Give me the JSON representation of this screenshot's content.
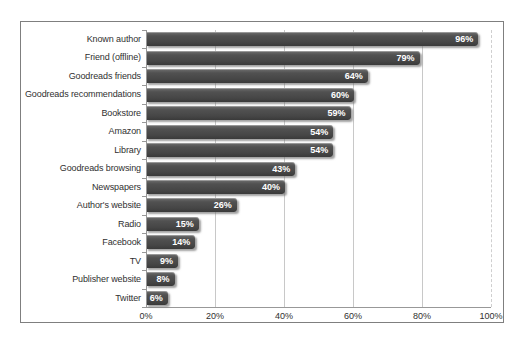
{
  "chart_data": {
    "type": "bar",
    "orientation": "horizontal",
    "title": "",
    "xlabel": "",
    "ylabel": "",
    "categories": [
      "Known author",
      "Friend (offline)",
      "Goodreads friends",
      "Goodreads recommendations",
      "Bookstore",
      "Amazon",
      "Library",
      "Goodreads browsing",
      "Newspapers",
      "Author's website",
      "Radio",
      "Facebook",
      "TV",
      "Publisher website",
      "Twitter"
    ],
    "values": [
      96,
      79,
      64,
      60,
      59,
      54,
      54,
      43,
      40,
      26,
      15,
      14,
      9,
      8,
      6
    ],
    "data_labels": [
      "96%",
      "79%",
      "64%",
      "60%",
      "59%",
      "54%",
      "54%",
      "43%",
      "40%",
      "26%",
      "15%",
      "14%",
      "9%",
      "8%",
      "6%"
    ],
    "xlim": [
      0,
      100
    ],
    "x_ticks": [
      {
        "value": 0,
        "label": "0%"
      },
      {
        "value": 20,
        "label": "20%"
      },
      {
        "value": 40,
        "label": "40%"
      },
      {
        "value": 60,
        "label": "60%"
      },
      {
        "value": 80,
        "label": "80%"
      },
      {
        "value": 100,
        "label": "100%"
      }
    ],
    "grid": "vertical",
    "legend": "none",
    "colors": {
      "bar_fill": "#4a4a4a",
      "bar_value_text": "#ffffff",
      "category_text": "#303030",
      "tick_text": "#303030",
      "gridline": "#c8c8c8",
      "axis_line": "#989898",
      "frame_border": "#7f7f7f",
      "background": "#ffffff"
    }
  }
}
